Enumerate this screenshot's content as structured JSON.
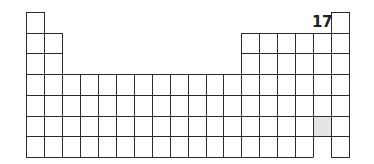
{
  "diagram": {
    "title": "",
    "type": "periodic-table-outline",
    "grid": {
      "left": 26,
      "top": 12,
      "col_width": 17.95,
      "row_height": 20.7,
      "columns": 18,
      "rows": 7
    },
    "rows": [
      {
        "period": 1,
        "columns": [
          1,
          18
        ]
      },
      {
        "period": 2,
        "columns": [
          1,
          2,
          13,
          14,
          15,
          16,
          17,
          18
        ]
      },
      {
        "period": 3,
        "columns": [
          1,
          2,
          13,
          14,
          15,
          16,
          17,
          18
        ]
      },
      {
        "period": 4,
        "columns": [
          1,
          2,
          3,
          4,
          5,
          6,
          7,
          8,
          9,
          10,
          11,
          12,
          13,
          14,
          15,
          16,
          17,
          18
        ]
      },
      {
        "period": 5,
        "columns": [
          1,
          2,
          3,
          4,
          5,
          6,
          7,
          8,
          9,
          10,
          11,
          12,
          13,
          14,
          15,
          16,
          17,
          18
        ]
      },
      {
        "period": 6,
        "columns": [
          1,
          2,
          3,
          4,
          5,
          6,
          7,
          8,
          9,
          10,
          11,
          12,
          13,
          14,
          15,
          16,
          17,
          18
        ]
      },
      {
        "period": 7,
        "columns": [
          1,
          2,
          3,
          4,
          5,
          6,
          7,
          8,
          9,
          10,
          11,
          12,
          13,
          14,
          15,
          16,
          17,
          18
        ]
      }
    ],
    "highlighted_cells": [
      {
        "period": 6,
        "group": 17,
        "color": "#e4e4e4"
      }
    ],
    "open_bottom_cells": [
      {
        "period": 7,
        "group": 17
      }
    ],
    "group_label": {
      "text": "17",
      "group": 17
    }
  }
}
